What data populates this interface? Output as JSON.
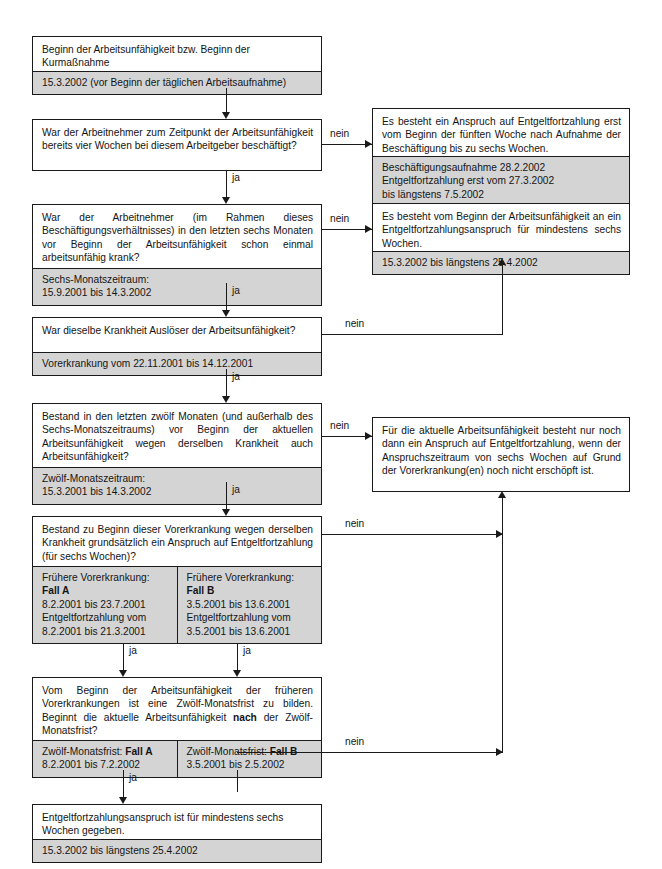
{
  "diagram": {
    "colors": {
      "line": "#1a1a1a",
      "box_fill": "#ffffff",
      "data_fill": "#d4d4d4",
      "text": "#141414"
    },
    "labels": {
      "yes": "ja",
      "no": "nein"
    },
    "nodes": [
      {
        "id": "start",
        "question": "Beginn der Arbeitsunfähigkeit bzw. Beginn der Kurmaßnahme",
        "data": [
          "15.3.2002 (vor Beginn der täglichen Arbeitsaufnahme)"
        ]
      },
      {
        "id": "q1",
        "question": "War der Arbeitnehmer zum Zeitpunkt der Arbeitsunfähigkeit bereits vier Wochen bei diesem Arbeitgeber beschäftigt?",
        "data": []
      },
      {
        "id": "r1",
        "question": "Es besteht ein Anspruch auf Entgeltfortzahlung erst vom Beginn der fünften Woche nach Aufnahme der Beschäftigung bis zu sechs Wochen.",
        "data": [
          "Beschäftigungsaufnahme 28.2.2002",
          "Entgeltfortzahlung erst vom 27.3.2002",
          "bis längstens 7.5.2002"
        ]
      },
      {
        "id": "q2",
        "question": "War der Arbeitnehmer (im Rahmen dieses Beschäftigungsverhältnisses) in den letzten sechs Monaten vor Beginn der Arbeitsunfähigkeit schon einmal arbeitsunfähig krank?",
        "data": [
          "Sechs-Monatszeitraum:",
          "15.9.2001 bis 14.3.2002"
        ]
      },
      {
        "id": "r2",
        "question": "Es besteht vom Beginn der Arbeitsunfähigkeit an ein Entgeltfortzahlungsanspruch für mindestens sechs Wochen.",
        "data": [
          "15.3.2002 bis längstens 25.4.2002"
        ]
      },
      {
        "id": "q3",
        "question": "War dieselbe Krankheit Auslöser der Arbeitsunfähigkeit?",
        "data": [
          "Vorerkrankung vom 22.11.2001 bis 14.12.2001"
        ]
      },
      {
        "id": "q4",
        "question": "Bestand in den letzten zwölf Monaten (und außerhalb des Sechs-Monatszeitraums) vor Beginn der aktuellen Arbeitsunfähigkeit wegen derselben Krankheit auch Arbeitsunfähigkeit?",
        "data": [
          "Zwölf-Monatszeitraum:",
          "15.3.2001 bis 14.3.2002"
        ]
      },
      {
        "id": "r3",
        "question": "Für die aktuelle Arbeitsunfähigkeit besteht nur noch dann ein Anspruch auf Entgeltfortzahlung, wenn der Anspruchszeitraum von sechs Wochen auf Grund der Vorerkrankung(en) noch nicht erschöpft ist.",
        "data": []
      },
      {
        "id": "q5",
        "question": "Bestand zu Beginn dieser Vorerkrankung wegen derselben Krankheit grundsätzlich ein Anspruch auf Entgeltfortzahlung (für sechs Wochen)?",
        "columns": [
          {
            "heading": "Frühere Vorerkrankung:",
            "case": "Fall A",
            "lines": [
              "8.2.2001 bis 23.7.2001",
              "Entgeltfortzahlung vom",
              "8.2.2001 bis 21.3.2001"
            ]
          },
          {
            "heading": "Frühere Vorerkrankung:",
            "case": "Fall B",
            "lines": [
              "3.5.2001 bis 13.6.2001",
              "Entgeltfortzahlung vom",
              "3.5.2001 bis 13.6.2001"
            ]
          }
        ]
      },
      {
        "id": "q6",
        "question_parts": [
          "Vom Beginn der Arbeitsunfähigkeit der früheren Vorerkrankungen ist eine Zwölf-Monatsfrist zu bilden. Beginnt die aktuelle Arbeitsunfähigkeit ",
          "nach",
          " der Zwölf-Monatsfrist?"
        ],
        "columns": [
          {
            "label": "Zwölf-Monatsfrist: ",
            "case": "Fall A",
            "lines": [
              "8.2.2001 bis 7.2.2002"
            ]
          },
          {
            "label": "Zwölf-Monatsfrist: ",
            "case": "Fall B",
            "lines": [
              "3.5.2001 bis 2.5.2002"
            ]
          }
        ]
      },
      {
        "id": "end",
        "question": "Entgeltfortzahlungsanspruch ist für mindestens sechs Wochen gegeben.",
        "data": [
          "15.3.2002 bis längstens 25.4.2002"
        ]
      }
    ]
  }
}
